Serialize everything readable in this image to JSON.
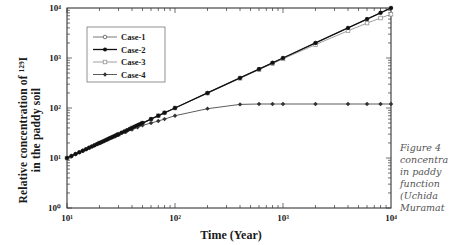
{
  "chart_data": {
    "type": "line",
    "scale": {
      "x": "log",
      "y": "log"
    },
    "title": "",
    "xlabel": "Time  (Year)",
    "ylabel_line1": "Relative  concentration  of  ¹²⁹I",
    "ylabel_line2": "in  the  paddy  soil",
    "xlim": [
      10,
      10000
    ],
    "ylim": [
      1,
      10000
    ],
    "x_ticks": [
      {
        "value": 10,
        "label": "10¹"
      },
      {
        "value": 100,
        "label": "10²"
      },
      {
        "value": 1000,
        "label": "10³"
      },
      {
        "value": 10000,
        "label": "10⁴"
      }
    ],
    "y_ticks": [
      {
        "value": 1,
        "label": "10⁰"
      },
      {
        "value": 10,
        "label": "10¹"
      },
      {
        "value": 100,
        "label": "10²"
      },
      {
        "value": 1000,
        "label": "10³"
      },
      {
        "value": 10000,
        "label": "10⁴"
      }
    ],
    "grid": false,
    "legend_position": "upper-left (inside)",
    "series": [
      {
        "name": "Case-1",
        "marker": "open-circle",
        "color": "#555555",
        "x": [
          10,
          11,
          12,
          13,
          14,
          15,
          16,
          17,
          18,
          19,
          20,
          21,
          22,
          23,
          24,
          25,
          26,
          27,
          28,
          29,
          30,
          32,
          34,
          36,
          38,
          40,
          42,
          44,
          46,
          48,
          50,
          60,
          70,
          80,
          100,
          200,
          400,
          600,
          800,
          1000,
          2000,
          4000,
          6000,
          8000,
          10000
        ],
        "y": [
          10,
          11,
          12,
          13,
          14,
          15,
          16,
          17,
          18,
          19,
          20,
          21,
          22,
          23,
          24,
          25,
          26,
          27,
          28,
          29,
          30,
          32,
          34,
          36,
          38,
          40,
          42,
          44,
          46,
          48,
          50,
          60,
          70,
          80,
          100,
          200,
          400,
          600,
          800,
          1000,
          2000,
          4000,
          6000,
          8000,
          10000
        ]
      },
      {
        "name": "Case-2",
        "marker": "filled-circle",
        "color": "#111111",
        "x": [
          10,
          11,
          12,
          13,
          14,
          15,
          16,
          17,
          18,
          19,
          20,
          21,
          22,
          23,
          24,
          25,
          26,
          27,
          28,
          29,
          30,
          32,
          34,
          36,
          38,
          40,
          42,
          44,
          46,
          48,
          50,
          60,
          70,
          80,
          100,
          200,
          400,
          600,
          800,
          1000,
          2000,
          4000,
          6000,
          8000,
          10000
        ],
        "y": [
          10,
          11,
          12,
          13,
          14,
          15,
          16,
          17,
          18,
          19,
          20,
          21,
          22,
          23,
          24,
          25,
          26,
          27,
          28,
          29,
          30,
          32,
          34,
          36,
          38,
          40,
          42,
          44,
          46,
          48,
          50,
          60,
          70,
          80,
          100,
          200,
          400,
          600,
          800,
          1000,
          2000,
          4000,
          6000,
          8000,
          10000
        ]
      },
      {
        "name": "Case-3",
        "marker": "open-square",
        "color": "#888888",
        "x": [
          10,
          20,
          30,
          40,
          50,
          60,
          70,
          80,
          100,
          200,
          400,
          600,
          800,
          1000,
          2000,
          4000,
          6000,
          8000,
          10000
        ],
        "y": [
          10,
          20,
          30,
          40,
          50,
          60,
          70,
          80,
          100,
          198,
          392,
          585,
          775,
          960,
          1850,
          3500,
          5000,
          6300,
          7500
        ]
      },
      {
        "name": "Case-4",
        "marker": "filled-diamond",
        "color": "#333333",
        "x": [
          10,
          12,
          14,
          16,
          18,
          20,
          22,
          24,
          26,
          28,
          30,
          35,
          40,
          45,
          50,
          60,
          70,
          80,
          100,
          200,
          400,
          600,
          800,
          1000,
          2000,
          4000,
          6000,
          8000,
          10000
        ],
        "y": [
          10,
          12,
          14,
          16,
          18,
          19.8,
          21.7,
          23.6,
          25.5,
          27.3,
          29,
          33,
          37,
          41,
          45,
          50,
          55,
          60,
          70,
          97,
          118,
          120,
          120,
          120,
          120,
          120,
          120,
          120,
          120
        ]
      }
    ]
  },
  "caption": {
    "lines": [
      "Figure 4",
      "concentra",
      "in paddy",
      "function",
      "(Uchida",
      "Muramat"
    ]
  }
}
